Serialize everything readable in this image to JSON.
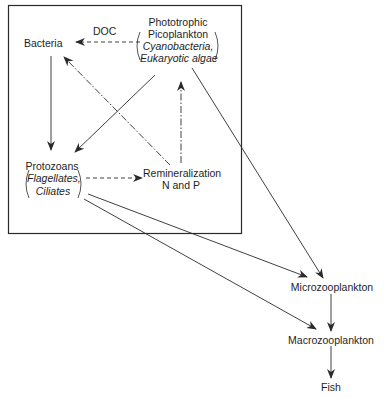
{
  "diagram": {
    "type": "microbial-loop-food-web",
    "colors": {
      "line": "#2a2a2a",
      "text": "#1e1e1e",
      "background": "#ffffff"
    },
    "box": {
      "label": "microbial loop box"
    },
    "nodes": {
      "bacteria": {
        "label": "Bacteria"
      },
      "picoplankton": {
        "line1": "Phototrophic",
        "line2": "Picoplankton",
        "example1": "Cyanobacteria,",
        "example2": "Eukaryotic algae"
      },
      "protozoans": {
        "line1": "Protozoans",
        "example1": "Flagellates,",
        "example2": "Ciliates"
      },
      "remineralization": {
        "line1": "Remineralization",
        "line2": "N and P"
      },
      "microzooplankton": {
        "label": "Microzooplankton"
      },
      "macrozooplankton": {
        "label": "Macrozooplankton"
      },
      "fish": {
        "label": "Fish"
      }
    },
    "edge_labels": {
      "doc": "DOC"
    },
    "edges": [
      {
        "from": "picoplankton",
        "to": "bacteria",
        "style": "dashed",
        "label": "DOC"
      },
      {
        "from": "bacteria",
        "to": "protozoans",
        "style": "solid"
      },
      {
        "from": "picoplankton",
        "to": "protozoans",
        "style": "solid"
      },
      {
        "from": "remineralization",
        "to": "bacteria",
        "style": "dash-dot"
      },
      {
        "from": "remineralization",
        "to": "picoplankton",
        "style": "dash-dot"
      },
      {
        "from": "protozoans",
        "to": "remineralization",
        "style": "dashed"
      },
      {
        "from": "picoplankton",
        "to": "microzooplankton",
        "style": "solid"
      },
      {
        "from": "protozoans",
        "to": "microzooplankton",
        "style": "solid"
      },
      {
        "from": "protozoans",
        "to": "macrozooplankton",
        "style": "solid"
      },
      {
        "from": "microzooplankton",
        "to": "macrozooplankton",
        "style": "solid"
      },
      {
        "from": "macrozooplankton",
        "to": "fish",
        "style": "solid"
      }
    ]
  }
}
